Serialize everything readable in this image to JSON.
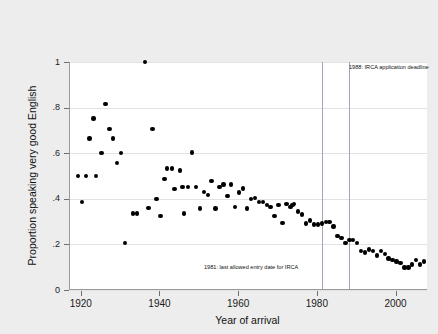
{
  "chart_data": {
    "type": "scatter",
    "title": "",
    "xlabel": "Year of arrival",
    "ylabel": "Proportion speaking very good English",
    "xlim": [
      1917,
      2008
    ],
    "ylim": [
      0,
      1.0
    ],
    "xticks": [
      1920,
      1940,
      1960,
      1980,
      2000
    ],
    "xtick_labels": [
      "1920",
      "1940",
      "1960",
      "1980",
      "2000"
    ],
    "yticks": [
      0,
      0.2,
      0.4,
      0.6,
      0.8,
      1.0
    ],
    "ytick_labels": [
      "0",
      ".2",
      ".4",
      ".6",
      ".8",
      "1"
    ],
    "grid": true,
    "legend": "none",
    "marker": "filled-circle",
    "marker_color": "#000000",
    "background_color": "#ededed",
    "plot_background_color": "#ffffff",
    "gridline_color": "#e2e2e2",
    "reference_line_color": "#9fa6b4",
    "reference_lines": [
      {
        "x": 1981,
        "label": "1981: last allowed entry date for IRCA"
      },
      {
        "x": 1988,
        "label": "1988: IRCA application deadline"
      }
    ],
    "points": [
      {
        "x": 1919,
        "y": 0.5
      },
      {
        "x": 1920,
        "y": 0.385
      },
      {
        "x": 1921,
        "y": 0.5
      },
      {
        "x": 1922,
        "y": 0.665
      },
      {
        "x": 1923,
        "y": 0.752
      },
      {
        "x": 1923.6,
        "y": 0.5
      },
      {
        "x": 1925,
        "y": 0.6
      },
      {
        "x": 1926,
        "y": 0.815
      },
      {
        "x": 1927,
        "y": 0.705
      },
      {
        "x": 1928,
        "y": 0.665
      },
      {
        "x": 1929,
        "y": 0.558
      },
      {
        "x": 1930,
        "y": 0.6
      },
      {
        "x": 1931,
        "y": 0.205
      },
      {
        "x": 1933,
        "y": 0.335
      },
      {
        "x": 1934,
        "y": 0.335
      },
      {
        "x": 1936,
        "y": 1.0
      },
      {
        "x": 1937,
        "y": 0.36
      },
      {
        "x": 1938,
        "y": 0.705
      },
      {
        "x": 1939,
        "y": 0.4
      },
      {
        "x": 1940,
        "y": 0.325
      },
      {
        "x": 1941,
        "y": 0.488
      },
      {
        "x": 1941.6,
        "y": 0.533
      },
      {
        "x": 1943,
        "y": 0.533
      },
      {
        "x": 1943.6,
        "y": 0.444
      },
      {
        "x": 1945,
        "y": 0.525
      },
      {
        "x": 1945.6,
        "y": 0.452
      },
      {
        "x": 1946,
        "y": 0.335
      },
      {
        "x": 1947,
        "y": 0.452
      },
      {
        "x": 1948,
        "y": 0.603
      },
      {
        "x": 1949,
        "y": 0.452
      },
      {
        "x": 1950,
        "y": 0.358
      },
      {
        "x": 1951,
        "y": 0.43
      },
      {
        "x": 1952,
        "y": 0.418
      },
      {
        "x": 1953,
        "y": 0.478
      },
      {
        "x": 1954,
        "y": 0.358
      },
      {
        "x": 1955,
        "y": 0.452
      },
      {
        "x": 1956,
        "y": 0.462
      },
      {
        "x": 1957,
        "y": 0.413
      },
      {
        "x": 1958,
        "y": 0.462
      },
      {
        "x": 1959,
        "y": 0.364
      },
      {
        "x": 1960,
        "y": 0.428
      },
      {
        "x": 1961,
        "y": 0.445
      },
      {
        "x": 1962,
        "y": 0.358
      },
      {
        "x": 1963,
        "y": 0.398
      },
      {
        "x": 1964,
        "y": 0.404
      },
      {
        "x": 1965,
        "y": 0.385
      },
      {
        "x": 1966,
        "y": 0.385
      },
      {
        "x": 1967,
        "y": 0.372
      },
      {
        "x": 1968,
        "y": 0.364
      },
      {
        "x": 1969,
        "y": 0.325
      },
      {
        "x": 1970,
        "y": 0.372
      },
      {
        "x": 1971,
        "y": 0.295
      },
      {
        "x": 1972,
        "y": 0.378
      },
      {
        "x": 1973,
        "y": 0.364
      },
      {
        "x": 1973.6,
        "y": 0.372
      },
      {
        "x": 1974,
        "y": 0.378
      },
      {
        "x": 1975,
        "y": 0.345
      },
      {
        "x": 1976,
        "y": 0.332
      },
      {
        "x": 1977,
        "y": 0.291
      },
      {
        "x": 1978,
        "y": 0.305
      },
      {
        "x": 1979,
        "y": 0.288
      },
      {
        "x": 1980,
        "y": 0.288
      },
      {
        "x": 1981,
        "y": 0.291
      },
      {
        "x": 1982,
        "y": 0.297
      },
      {
        "x": 1983,
        "y": 0.297
      },
      {
        "x": 1984,
        "y": 0.278
      },
      {
        "x": 1985,
        "y": 0.238
      },
      {
        "x": 1986,
        "y": 0.228
      },
      {
        "x": 1987,
        "y": 0.205
      },
      {
        "x": 1988,
        "y": 0.218
      },
      {
        "x": 1989,
        "y": 0.218
      },
      {
        "x": 1990,
        "y": 0.205
      },
      {
        "x": 1991,
        "y": 0.172
      },
      {
        "x": 1992,
        "y": 0.165
      },
      {
        "x": 1993,
        "y": 0.178
      },
      {
        "x": 1994,
        "y": 0.172
      },
      {
        "x": 1995,
        "y": 0.152
      },
      {
        "x": 1996,
        "y": 0.172
      },
      {
        "x": 1997,
        "y": 0.158
      },
      {
        "x": 1998,
        "y": 0.138
      },
      {
        "x": 1999,
        "y": 0.132
      },
      {
        "x": 2000,
        "y": 0.125
      },
      {
        "x": 2001,
        "y": 0.118
      },
      {
        "x": 2002,
        "y": 0.099
      },
      {
        "x": 2003,
        "y": 0.099
      },
      {
        "x": 2004,
        "y": 0.112
      },
      {
        "x": 2005,
        "y": 0.132
      },
      {
        "x": 2006,
        "y": 0.112
      },
      {
        "x": 2007,
        "y": 0.125
      }
    ]
  }
}
